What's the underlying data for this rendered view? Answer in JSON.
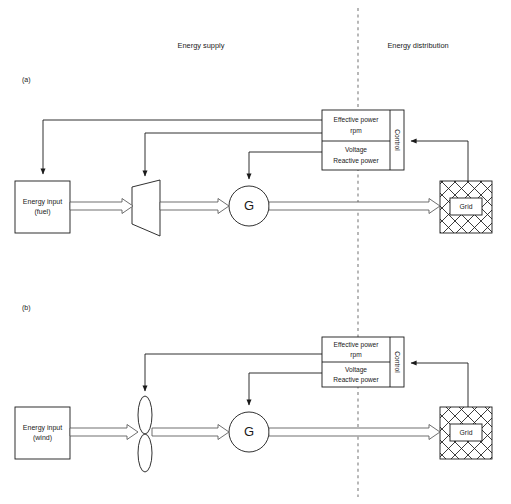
{
  "figure": {
    "sections": [
      {
        "id": "supply",
        "label": "Energy supply"
      },
      {
        "id": "distribution",
        "label": "Energy distribution"
      }
    ],
    "divider": {
      "name": "supply-distribution-divider",
      "style": "dashed-vertical"
    }
  },
  "panels": [
    {
      "id": "a",
      "label": "(a)",
      "source_type": "fuel",
      "energy_input": {
        "line1": "Energy input",
        "line2": "(fuel)"
      },
      "converter": {
        "name": "turbine",
        "shape": "trapezoid",
        "label": ""
      },
      "generator": {
        "label": "G"
      },
      "grid": {
        "label": "Grid"
      },
      "control": {
        "title": "Control",
        "cells": [
          {
            "line1": "Effective power",
            "line2": "rpm"
          },
          {
            "line1": "Voltage",
            "line2": "Reactive power"
          }
        ]
      },
      "signal_targets": [
        "energy-input",
        "turbine",
        "generator"
      ],
      "flow_chain": [
        "energy-input",
        "turbine",
        "generator",
        "grid"
      ]
    },
    {
      "id": "b",
      "label": "(b)",
      "source_type": "wind",
      "energy_input": {
        "line1": "Energy input",
        "line2": "(wind)"
      },
      "converter": {
        "name": "wind-rotor",
        "shape": "two-blade-rotor",
        "label": ""
      },
      "generator": {
        "label": "G"
      },
      "grid": {
        "label": "Grid"
      },
      "control": {
        "title": "Control",
        "cells": [
          {
            "line1": "Effective power",
            "line2": "rpm"
          },
          {
            "line1": "Voltage",
            "line2": "Reactive power"
          }
        ]
      },
      "signal_targets": [
        "wind-rotor",
        "generator"
      ],
      "flow_chain": [
        "energy-input",
        "wind-rotor",
        "generator",
        "grid"
      ]
    }
  ],
  "colors": {
    "line": "#1a1a1a",
    "flow_arrow_stroke": "#555555",
    "divider": "#9a9a9a",
    "background": "#ffffff"
  }
}
